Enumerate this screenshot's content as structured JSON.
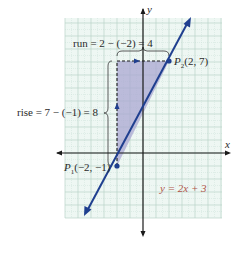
{
  "chart_data": {
    "type": "line",
    "title": "",
    "xlabel": "x",
    "ylabel": "y",
    "xlim": [
      -6,
      6
    ],
    "ylim": [
      -5,
      10.4
    ],
    "grid": true,
    "grid_minor": true,
    "series": [
      {
        "name": "y = 2x + 3",
        "slope": 2,
        "intercept": 3,
        "x": [
          -5.8,
          4.1
        ],
        "y": [
          -8.6,
          11.2
        ],
        "color": "#1f3f8f"
      }
    ],
    "points": [
      {
        "label": "P1",
        "x": -2,
        "y": -1,
        "text": "P₁(−2, −1)"
      },
      {
        "label": "P2",
        "x": 2,
        "y": 7,
        "text": "P₂(2, 7)"
      }
    ],
    "annotations": [
      {
        "text": "run = 2 − (−2) = 4",
        "type": "horizontal-brace"
      },
      {
        "text": "rise = 7 − (−1) = 8",
        "type": "vertical-brace"
      },
      {
        "text": "y = 2x + 3",
        "type": "equation-label"
      }
    ],
    "shaded_triangle": [
      [
        -2,
        -1
      ],
      [
        -2,
        7
      ],
      [
        2,
        7
      ]
    ]
  },
  "labels": {
    "y_axis": "y",
    "x_axis": "x",
    "run": "run = 2 − (−2) = 4",
    "rise": "rise = 7 − (−1) = 8",
    "p1": "P₁(−2, −1)",
    "p2": "P₂(2, 7)",
    "equation": "y = 2x + 3"
  },
  "colors": {
    "grid_bg": "#eef7f3",
    "grid_line": "#b9d3c8",
    "shade": "#a9a7d1",
    "line": "#1f3f8f",
    "axis": "#1a1a1a",
    "equation": "#b0564a"
  }
}
